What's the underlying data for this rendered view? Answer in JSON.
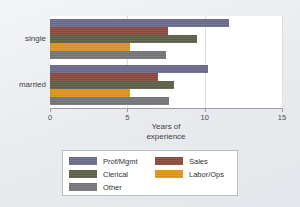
{
  "chart_data": {
    "type": "bar",
    "orientation": "horizontal",
    "title": "",
    "xlabel": "Years of experience",
    "ylabel": "",
    "categories": [
      "single",
      "married"
    ],
    "xlim": [
      0,
      15
    ],
    "xticks": [
      0,
      5,
      10,
      15
    ],
    "xtick_labels": [
      "0",
      "5",
      "10",
      "15"
    ],
    "grid": true,
    "legend_position": "bottom",
    "series": [
      {
        "name": "Prof/Mgmt",
        "color": "#6b6b8f",
        "values": [
          11.6,
          10.2
        ]
      },
      {
        "name": "Sales",
        "color": "#8c4a3c",
        "values": [
          7.6,
          7.0
        ]
      },
      {
        "name": "Clerical",
        "color": "#5c6148",
        "values": [
          9.5,
          8.0
        ]
      },
      {
        "name": "Labor/Ops",
        "color": "#e0941f",
        "values": [
          5.2,
          5.2
        ]
      },
      {
        "name": "Other",
        "color": "#74767a",
        "values": [
          7.5,
          7.7
        ]
      }
    ]
  },
  "axis_title_lines": [
    "Years of",
    "experience"
  ],
  "legend": {
    "columns": [
      [
        "Prof/Mgmt",
        "Clerical",
        "Other"
      ],
      [
        "Sales",
        "Labor/Ops"
      ]
    ]
  }
}
